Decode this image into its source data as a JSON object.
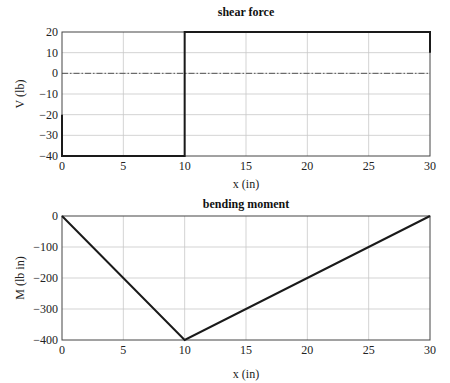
{
  "chart_data": [
    {
      "type": "line",
      "title": "shear force",
      "xlabel": "x (in)",
      "ylabel": "V (lb)",
      "xlim": [
        0,
        30
      ],
      "ylim": [
        -40,
        20
      ],
      "xticks": [
        0,
        5,
        10,
        15,
        20,
        25,
        30
      ],
      "yticks": [
        20,
        10,
        0,
        -10,
        -20,
        -30,
        -40
      ],
      "grid": true,
      "zero_line": {
        "y": 0,
        "style": "dash-dot"
      },
      "series": [
        {
          "name": "V",
          "x": [
            0,
            0,
            10,
            10,
            30,
            30
          ],
          "y": [
            -20,
            -40,
            -40,
            20,
            20,
            10
          ]
        }
      ]
    },
    {
      "type": "line",
      "title": "bending moment",
      "xlabel": "x (in)",
      "ylabel": "M (lb in)",
      "xlim": [
        0,
        30
      ],
      "ylim": [
        -400,
        0
      ],
      "xticks": [
        0,
        5,
        10,
        15,
        20,
        25,
        30
      ],
      "yticks": [
        0,
        -100,
        -200,
        -300,
        -400
      ],
      "grid": true,
      "series": [
        {
          "name": "M",
          "x": [
            0,
            10,
            30
          ],
          "y": [
            0,
            -400,
            0
          ]
        }
      ]
    }
  ]
}
